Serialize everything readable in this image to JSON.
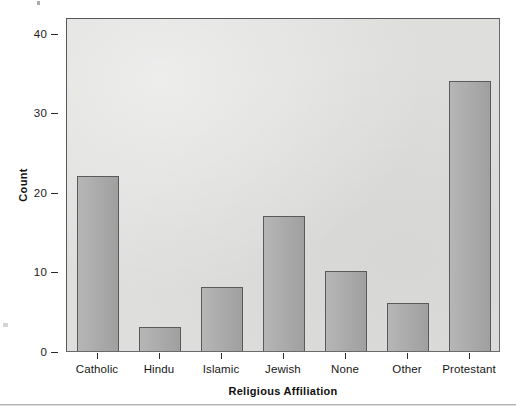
{
  "chart_data": {
    "type": "bar",
    "title": "",
    "subtitle": "",
    "xlabel": "Religious Affiliation",
    "ylabel": "Count",
    "categories": [
      "Catholic",
      "Hindu",
      "Islamic",
      "Jewish",
      "None",
      "Other",
      "Protestant"
    ],
    "values": [
      22,
      3,
      8,
      17,
      10,
      6,
      34
    ],
    "ylim": [
      0,
      42
    ],
    "yticks": [
      0,
      10,
      20,
      30,
      40
    ],
    "ytick_labels": [
      "0",
      "10",
      "20",
      "30",
      "40"
    ],
    "grid": false,
    "legend": null,
    "legend_position": "none",
    "annotations": [],
    "colors": {
      "bar_fill": "#a8a8a8",
      "bar_border": "#595a5c",
      "panel_background": "#dededd",
      "panel_border": "#58585a",
      "axis_text": "#1a1a1a",
      "figure_background": "#ffffff"
    }
  },
  "figure": {
    "axis_title_x": "Religious Affiliation",
    "axis_title_y": "Count"
  }
}
